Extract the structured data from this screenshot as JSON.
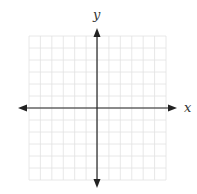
{
  "diagram": {
    "type": "cartesian-coordinate-plane",
    "x_axis_label": "x",
    "y_axis_label": "y",
    "grid": {
      "columns": 12,
      "rows": 12,
      "cells_left_of_y_axis": 6,
      "cells_right_of_y_axis": 6,
      "cells_above_x_axis": 6,
      "cells_below_x_axis": 6,
      "line_color": "#e2e2e2"
    },
    "axis_color": "#222222",
    "arrows": [
      "left",
      "right",
      "up",
      "down"
    ],
    "tick_labels": [],
    "plotted_points": []
  }
}
